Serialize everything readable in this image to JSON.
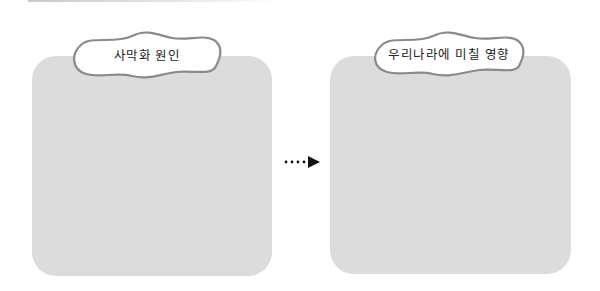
{
  "diagram": {
    "left_box": {
      "title": "사막화 원인",
      "content": ""
    },
    "right_box": {
      "title": "우리나라에 미칠 영향",
      "content": ""
    },
    "connector": {
      "type": "dotted-arrow",
      "direction": "right"
    }
  },
  "colors": {
    "panel_fill": "#dcdcdc",
    "cloud_fill": "#ffffff",
    "cloud_stroke": "#8a8a8a",
    "arrow": "#111111"
  }
}
